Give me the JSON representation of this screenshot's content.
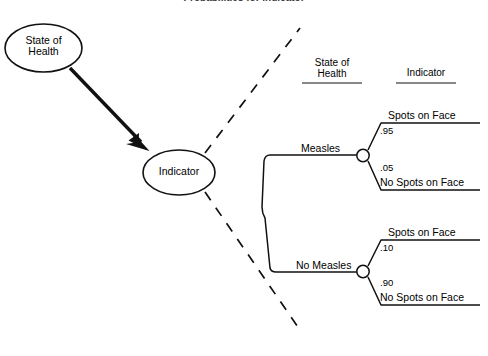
{
  "title": "Probabilities for Indicator",
  "influence_diagram": {
    "nodes": [
      {
        "id": "state-of-health",
        "line1": "State of",
        "line2": "Health"
      },
      {
        "id": "indicator",
        "line1": "Indicator",
        "line2": ""
      }
    ],
    "arrow": {
      "from": "state-of-health",
      "to": "indicator"
    }
  },
  "tree": {
    "columns": [
      {
        "id": "state-of-health-col",
        "line1": "State of",
        "line2": "Health"
      },
      {
        "id": "indicator-col",
        "line1": "Indicator",
        "line2": ""
      }
    ],
    "branches": [
      {
        "id": "measles",
        "label": "Measles",
        "outcomes": [
          {
            "id": "measles-spots",
            "prob": ".95",
            "label": "Spots on Face"
          },
          {
            "id": "measles-no-spots",
            "prob": ".05",
            "label": "No Spots on Face"
          }
        ]
      },
      {
        "id": "no-measles",
        "label": "No Measles",
        "outcomes": [
          {
            "id": "no-measles-spots",
            "prob": ".10",
            "label": "Spots on Face"
          },
          {
            "id": "no-measles-no-spots",
            "prob": ".90",
            "label": "No Spots on Face"
          }
        ]
      }
    ]
  },
  "colors": {
    "stroke": "#111111",
    "background": "#ffffff",
    "title": "#3a3a3a"
  }
}
